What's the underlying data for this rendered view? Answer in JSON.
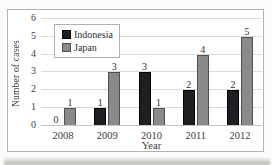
{
  "chart_data": {
    "type": "bar",
    "title": "",
    "xlabel": "Year",
    "ylabel": "Number of cases",
    "categories": [
      "2008",
      "2009",
      "2010",
      "2011",
      "2012"
    ],
    "series": [
      {
        "name": "Indonesia",
        "color": "#1f1f23",
        "border": "#000000",
        "values": [
          0,
          1,
          3,
          2,
          2
        ]
      },
      {
        "name": "Japan",
        "color": "#8a8a8d",
        "border": "#4f4f52",
        "values": [
          1,
          3,
          1,
          4,
          5
        ]
      }
    ],
    "ylim": [
      0,
      6
    ],
    "yticks": [
      0,
      1,
      2,
      3,
      4,
      5,
      6
    ],
    "grid": "horizontal",
    "legend_position": "top-left-inside",
    "data_labels_shown": true
  },
  "figure_style": {
    "frame_border_color": "#b3b3b3",
    "gridline_color": "#dadada",
    "axis_line_color": "#c4c4c4",
    "text_color": "#3b3b3b",
    "background": "#ffffff"
  }
}
